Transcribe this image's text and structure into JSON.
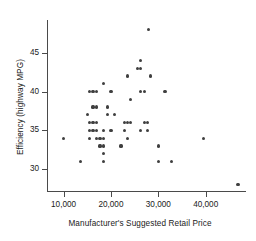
{
  "chart_data": {
    "type": "scatter",
    "title": "",
    "xlabel": "Manufacturer's Suggested Retail Price",
    "ylabel": "Efficiency (highway MPG)",
    "xlim": [
      6500,
      48500
    ],
    "ylim": [
      27.2,
      49.2
    ],
    "grid": false,
    "legend": null,
    "xticks": [
      10000,
      20000,
      30000,
      40000
    ],
    "xtick_labels": [
      "10,000",
      "20,000",
      "30,000",
      "40,000"
    ],
    "yticks": [
      30,
      35,
      40,
      45
    ],
    "ytick_labels": [
      "30",
      "35",
      "40",
      "45"
    ],
    "marker": "filled-circle",
    "marker_color": "#3f3f3f",
    "points": [
      [
        10000,
        34
      ],
      [
        13500,
        31
      ],
      [
        15000,
        37
      ],
      [
        15500,
        40
      ],
      [
        16200,
        40
      ],
      [
        16900,
        40
      ],
      [
        15500,
        35
      ],
      [
        16200,
        35
      ],
      [
        16900,
        35
      ],
      [
        15500,
        36
      ],
      [
        16200,
        36
      ],
      [
        16900,
        36
      ],
      [
        16200,
        38
      ],
      [
        17000,
        38
      ],
      [
        15500,
        34
      ],
      [
        17000,
        34
      ],
      [
        17700,
        34
      ],
      [
        18400,
        34
      ],
      [
        17700,
        33
      ],
      [
        18400,
        33
      ],
      [
        18400,
        32
      ],
      [
        18400,
        31
      ],
      [
        18400,
        35
      ],
      [
        18400,
        41
      ],
      [
        20000,
        40
      ],
      [
        19300,
        38
      ],
      [
        19300,
        37
      ],
      [
        20700,
        37
      ],
      [
        20000,
        35
      ],
      [
        22800,
        36
      ],
      [
        23500,
        36
      ],
      [
        24200,
        36
      ],
      [
        22800,
        35
      ],
      [
        23500,
        34
      ],
      [
        22100,
        33
      ],
      [
        23500,
        42
      ],
      [
        24200,
        39
      ],
      [
        26300,
        44
      ],
      [
        25600,
        43
      ],
      [
        26300,
        43
      ],
      [
        26300,
        40
      ],
      [
        27000,
        40
      ],
      [
        28400,
        42
      ],
      [
        26300,
        35
      ],
      [
        27700,
        35
      ],
      [
        27000,
        36
      ],
      [
        27700,
        36
      ],
      [
        28000,
        48
      ],
      [
        30000,
        33
      ],
      [
        30000,
        31
      ],
      [
        31400,
        40
      ],
      [
        32800,
        31
      ],
      [
        39500,
        34
      ],
      [
        46800,
        28
      ]
    ]
  },
  "axes": {
    "y_title": "Efficiency (highway MPG)",
    "x_title": "Manufacturer's Suggested Retail Price"
  }
}
